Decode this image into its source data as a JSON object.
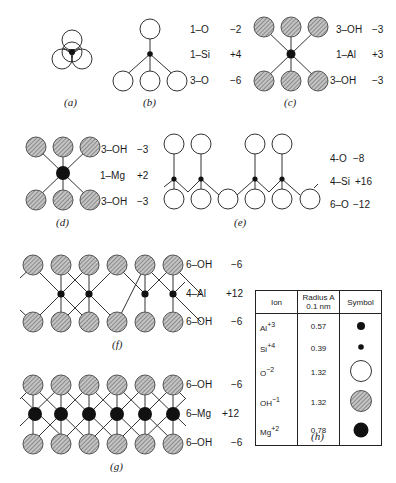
{
  "panels": {
    "a": {
      "caption": "(a)"
    },
    "b": {
      "caption": "(b)",
      "rows": [
        {
          "formula": "1–O",
          "charge": "−2"
        },
        {
          "formula": "1–Si",
          "charge": "+4"
        },
        {
          "formula": "3–O",
          "charge": "−6"
        }
      ]
    },
    "c": {
      "caption": "(c)",
      "rows": [
        {
          "formula": "3–OH",
          "charge": "−3"
        },
        {
          "formula": "1–Al",
          "charge": "+3"
        },
        {
          "formula": "3–OH",
          "charge": "−3"
        }
      ]
    },
    "d": {
      "caption": "(d)",
      "rows": [
        {
          "formula": "3–OH",
          "charge": "−3"
        },
        {
          "formula": "1–Mg",
          "charge": "+2"
        },
        {
          "formula": "3–OH",
          "charge": "−3"
        }
      ]
    },
    "e": {
      "caption": "(e)",
      "rows": [
        {
          "formula": "4-O",
          "charge": "−8"
        },
        {
          "formula": "4–Si",
          "charge": "+16"
        },
        {
          "formula": "6–O",
          "charge": "−12"
        }
      ]
    },
    "f": {
      "caption": "(f)",
      "rows": [
        {
          "formula": "6–OH",
          "charge": "−6"
        },
        {
          "formula": "4–Al",
          "charge": "+12"
        },
        {
          "formula": "6–OH",
          "charge": "−6"
        }
      ]
    },
    "g": {
      "caption": "(g)",
      "rows": [
        {
          "formula": "6–OH",
          "charge": "−6"
        },
        {
          "formula": "6–Mg",
          "charge": "+12"
        },
        {
          "formula": "6–OH",
          "charge": "−6"
        }
      ]
    },
    "h": {
      "caption": "(h)",
      "headers": [
        "Ion",
        "Radius A",
        "0.1 nm",
        "Symbol"
      ],
      "rows": [
        {
          "ion": "Al",
          "charge": "+3",
          "radius": "0.57",
          "symbol": "small-black-dot"
        },
        {
          "ion": "Si",
          "charge": "+4",
          "radius": "0.39",
          "symbol": "smallest-black-dot"
        },
        {
          "ion": "O",
          "charge": "−2",
          "radius": "1.32",
          "symbol": "large-open-circle"
        },
        {
          "ion": "OH",
          "charge": "−1",
          "radius": "1.32",
          "symbol": "large-hatched-circle"
        },
        {
          "ion": "Mg",
          "charge": "+2",
          "radius": "0.78",
          "symbol": "medium-black-dot"
        }
      ]
    }
  },
  "colors": {
    "line": "#333333",
    "hatch_fill": "#a8a8a8",
    "black": "#111111"
  }
}
